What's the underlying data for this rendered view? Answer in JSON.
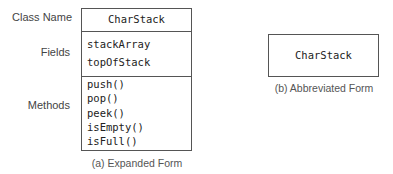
{
  "expanded": {
    "labels": {
      "class_name": "Class Name",
      "fields": "Fields",
      "methods": "Methods"
    },
    "class_name": "CharStack",
    "fields": [
      "stackArray",
      "topOfStack"
    ],
    "methods": [
      "push()",
      "pop()",
      "peek()",
      "isEmpty()",
      "isFull()"
    ],
    "caption": "(a) Expanded Form"
  },
  "abbreviated": {
    "class_name": "CharStack",
    "caption": "(b) Abbreviated Form"
  }
}
